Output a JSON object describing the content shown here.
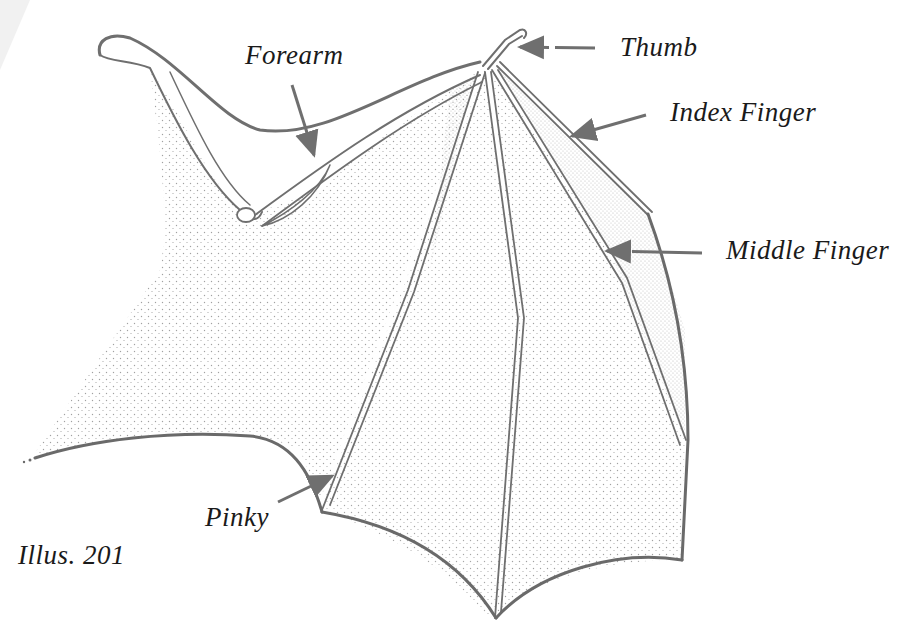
{
  "diagram": {
    "caption": "Illus. 201",
    "labels": {
      "forearm": "Forearm",
      "thumb": "Thumb",
      "index": "Index Finger",
      "middle": "Middle Finger",
      "pinky": "Pinky"
    },
    "colors": {
      "line": "#6f6f6f",
      "stipple": "#8a8a8a",
      "text": "#1a1a1a",
      "background": "#ffffff"
    }
  }
}
